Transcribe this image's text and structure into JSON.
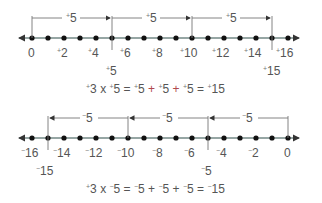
{
  "colors": {
    "axis": "#2f4f4a",
    "ink": "#555555",
    "bracket": "#777777",
    "plus_operator": "#b0484e",
    "dot": "#111111"
  },
  "top_line": {
    "range": [
      0,
      16
    ],
    "tick_labels": [
      {
        "value": 0,
        "sign": "",
        "text": "0"
      },
      {
        "value": 2,
        "sign": "+",
        "text": "2"
      },
      {
        "value": 4,
        "sign": "+",
        "text": "4"
      },
      {
        "value": 6,
        "sign": "+",
        "text": "6"
      },
      {
        "value": 8,
        "sign": "+",
        "text": "8"
      },
      {
        "value": 10,
        "sign": "+",
        "text": "10"
      },
      {
        "value": 12,
        "sign": "+",
        "text": "12"
      },
      {
        "value": 14,
        "sign": "+",
        "text": "14"
      },
      {
        "value": 16,
        "sign": "+",
        "text": "16"
      }
    ],
    "jumps": [
      {
        "from": 0,
        "to": 5,
        "sign": "+",
        "text": "5"
      },
      {
        "from": 5,
        "to": 10,
        "sign": "+",
        "text": "5"
      },
      {
        "from": 10,
        "to": 15,
        "sign": "+",
        "text": "5"
      }
    ],
    "markers": [
      {
        "value": 5,
        "sign": "+",
        "text": "5"
      },
      {
        "value": 15,
        "sign": "+",
        "text": "15"
      }
    ],
    "equation": {
      "parts": [
        "+",
        "3 x ",
        "+",
        "5 = ",
        "+",
        "5 ",
        "+",
        " ",
        "+",
        "5 ",
        "+",
        " ",
        "+",
        "5 = ",
        "+",
        "15"
      ]
    }
  },
  "bottom_line": {
    "range": [
      -16,
      0
    ],
    "tick_labels": [
      {
        "value": -16,
        "sign": "-",
        "text": "16"
      },
      {
        "value": -14,
        "sign": "-",
        "text": "14"
      },
      {
        "value": -12,
        "sign": "-",
        "text": "12"
      },
      {
        "value": -10,
        "sign": "-",
        "text": "10"
      },
      {
        "value": -8,
        "sign": "-",
        "text": "8"
      },
      {
        "value": -6,
        "sign": "-",
        "text": "6"
      },
      {
        "value": -4,
        "sign": "-",
        "text": "4"
      },
      {
        "value": -2,
        "sign": "-",
        "text": "2"
      },
      {
        "value": 0,
        "sign": "",
        "text": "0"
      }
    ],
    "jumps": [
      {
        "from": 0,
        "to": -5,
        "sign": "-",
        "text": "5"
      },
      {
        "from": -5,
        "to": -10,
        "sign": "-",
        "text": "5"
      },
      {
        "from": -10,
        "to": -15,
        "sign": "-",
        "text": "5"
      }
    ],
    "markers": [
      {
        "value": -5,
        "sign": "-",
        "text": "5"
      },
      {
        "value": -15,
        "sign": "-",
        "text": "15"
      }
    ]
  },
  "equations": {
    "top": {
      "a_sign": "+",
      "a": "3",
      "times": "x",
      "b_sign": "+",
      "b": "5",
      "eq": "=",
      "t1_sign": "+",
      "t1": "5",
      "plus1": "+",
      "t2_sign": "+",
      "t2": "5",
      "plus2": "+",
      "t3_sign": "+",
      "t3": "5",
      "eq2": "=",
      "r_sign": "+",
      "r": "15"
    },
    "bottom": {
      "a_sign": "+",
      "a": "3",
      "times": "x",
      "b_sign": "-",
      "b": "5",
      "eq": "=",
      "t1_sign": "-",
      "t1": "5",
      "plus1": "+",
      "t2_sign": "-",
      "t2": "5",
      "plus2": "+",
      "t3_sign": "-",
      "t3": "5",
      "eq2": "=",
      "r_sign": "-",
      "r": "15"
    }
  }
}
